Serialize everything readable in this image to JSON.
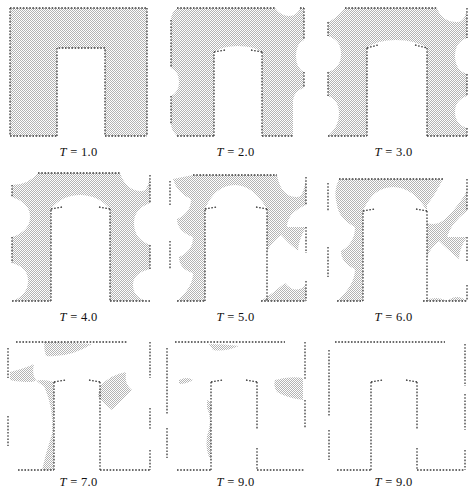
{
  "figure": {
    "title": "",
    "rows": 3,
    "columns": 3,
    "fill_color": "#c9c9c9",
    "boundary_color": "#3a3a3a",
    "background_color": "#ffffff"
  },
  "panels": [
    {
      "id": "panel-t1",
      "label": "T = 1.0",
      "time": 1.0,
      "row": 1,
      "col": 1
    },
    {
      "id": "panel-t2",
      "label": "T = 2.0",
      "time": 2.0,
      "row": 1,
      "col": 2
    },
    {
      "id": "panel-t3",
      "label": "T = 3.0",
      "time": 3.0,
      "row": 1,
      "col": 3
    },
    {
      "id": "panel-t4",
      "label": "T = 4.0",
      "time": 4.0,
      "row": 2,
      "col": 1
    },
    {
      "id": "panel-t5",
      "label": "T = 5.0",
      "time": 5.0,
      "row": 2,
      "col": 2
    },
    {
      "id": "panel-t6",
      "label": "T = 6.0",
      "time": 6.0,
      "row": 2,
      "col": 3
    },
    {
      "id": "panel-t7",
      "label": "T = 7.0",
      "time": 7.0,
      "row": 3,
      "col": 1
    },
    {
      "id": "panel-t8",
      "label": "T = 9.0",
      "time": 9.0,
      "row": 3,
      "col": 2
    },
    {
      "id": "panel-t9",
      "label": "T = 9.0",
      "time": 9.0,
      "row": 3,
      "col": 3
    }
  ],
  "chart_data": {
    "type": "area",
    "title": "",
    "subtitle": "",
    "xlabel": "",
    "ylabel": "",
    "xlim": [
      0,
      100
    ],
    "ylim": [
      0,
      100
    ],
    "grid": false,
    "legend": null,
    "series": [
      {
        "name": "T = 1.0",
        "time": 1.0,
        "filled_area_fraction": 0.72,
        "note": "Nearly full square minus a tall rectangular slot open at bottom-centre; boundary still straight on all sides."
      },
      {
        "name": "T = 2.0",
        "time": 2.0,
        "filled_area_fraction": 0.66,
        "note": "Corners rounded; small concave bites appear at mid-left, mid-right and top-right; slot top rounded."
      },
      {
        "name": "T = 3.0",
        "time": 3.0,
        "filled_area_fraction": 0.58,
        "note": "Circular voids grow from top-left, top-right, mid-left, mid-right and around the right slot wall."
      },
      {
        "name": "T = 4.0",
        "time": 4.0,
        "filled_area_fraction": 0.5,
        "note": "Slot cap becomes mushroom-shaped; large lobes removed from all four corners and both side mid-points."
      },
      {
        "name": "T = 5.0",
        "time": 5.0,
        "filled_area_fraction": 0.4,
        "note": "Remaining material forms connected arches; right lower block eroded into two cusped fragments."
      },
      {
        "name": "T = 6.0",
        "time": 6.0,
        "filled_area_fraction": 0.3,
        "note": "Only thin ligaments remain: a top arch over the slot and narrow vertical struts."
      },
      {
        "name": "T = 7.0",
        "time": 7.0,
        "filled_area_fraction": 0.16,
        "note": "Material breaks into three disconnected slivers near the top edge, left wall and right slot wall."
      },
      {
        "name": "T = 9.0",
        "time": 9.0,
        "filled_area_fraction": 0.04,
        "note": "Near-complete dissolution; only tiny residual specks along the left and right slot walls and top edge."
      },
      {
        "name": "T = 9.0",
        "time": 9.0,
        "filled_area_fraction": 0.0,
        "note": "Final state: material fully removed, only the dotted boundary outline of the U-shaped domain remains."
      }
    ]
  }
}
